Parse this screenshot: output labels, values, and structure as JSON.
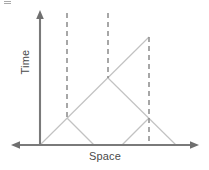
{
  "figure": {
    "background_color": "#ffffff",
    "width": 209,
    "height": 170
  },
  "axes": {
    "y_label": "Time",
    "x_label": "Space",
    "color": "#7a7a7a",
    "origin": {
      "x": 40,
      "y": 145
    },
    "y_axis": {
      "x": 40,
      "top_y": 11,
      "bottom_y": 145,
      "arrow": "up"
    },
    "x_axis": {
      "y": 145,
      "left_x": 13,
      "right_x": 197,
      "arrow": "both"
    }
  },
  "chart_data": {
    "type": "line",
    "xlabel": "Space",
    "ylabel": "Time",
    "grid": false,
    "legend": null,
    "axis_origin": {
      "x": 40,
      "y": 145
    },
    "note": "45-degree light-cone rays with three dashed vertical worldlines",
    "worldlines": [
      {
        "name": "worldline-1",
        "x": 67,
        "y_top": 13,
        "y_bottom": 118,
        "style": "dashed",
        "color": "#8a8a8a"
      },
      {
        "name": "worldline-2",
        "x": 108,
        "y_top": 13,
        "y_bottom": 78,
        "style": "dashed",
        "color": "#8a8a8a"
      },
      {
        "name": "worldline-3",
        "x": 149,
        "y_top": 37,
        "y_bottom": 145,
        "style": "dashed",
        "color": "#8a8a8a"
      }
    ],
    "rays": [
      {
        "name": "ray-origin-to-apex",
        "x1": 40,
        "y1": 145,
        "x2": 149,
        "y2": 37,
        "color": "#c2c2c2"
      },
      {
        "name": "ray-event1-down-right",
        "x1": 67,
        "y1": 118,
        "x2": 94,
        "y2": 145,
        "color": "#c2c2c2"
      },
      {
        "name": "ray-event2-down-right",
        "x1": 108,
        "y1": 78,
        "x2": 176,
        "y2": 145,
        "color": "#c2c2c2"
      },
      {
        "name": "ray-event3-down-left",
        "x1": 149,
        "y1": 118,
        "x2": 122,
        "y2": 145,
        "color": "#c2c2c2"
      }
    ],
    "events": [
      {
        "name": "event-1",
        "x": 67,
        "y": 118,
        "on_worldline": "worldline-1"
      },
      {
        "name": "event-2",
        "x": 108,
        "y": 78,
        "on_worldline": "worldline-2"
      },
      {
        "name": "event-3",
        "x": 149,
        "y": 118,
        "on_worldline": "worldline-3"
      },
      {
        "name": "apex",
        "x": 149,
        "y": 37,
        "on_worldline": "worldline-3"
      }
    ]
  }
}
